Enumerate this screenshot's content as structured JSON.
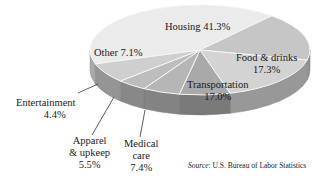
{
  "chart_data": {
    "type": "pie",
    "style": "3d",
    "title": "",
    "slices": [
      {
        "label": "Housing",
        "value": 41.3,
        "display": "Housing 41.3%",
        "color": "#ebebeb"
      },
      {
        "label": "Food & drinks",
        "value": 17.3,
        "display_line1": "Food & drinks",
        "display_line2": "17.3%",
        "color": "#c6c6c6"
      },
      {
        "label": "Transportation",
        "value": 17.0,
        "display_line1": "Transportation",
        "display_line2": "17.0%",
        "color": "#d3d3d3"
      },
      {
        "label": "Medical care",
        "value": 7.4,
        "display_line1": "Medical",
        "display_line2": "care",
        "display_line3": "7.4%",
        "color": "#a9a9a9"
      },
      {
        "label": "Apparel & upkeep",
        "value": 5.5,
        "display_line1": "Apparel",
        "display_line2": "& upkeep",
        "display_line3": "5.5%",
        "color": "#b6b6b6"
      },
      {
        "label": "Entertainment",
        "value": 4.4,
        "display_line1": "Entertainment",
        "display_line2": "4.4%",
        "color": "#bdbdbd"
      },
      {
        "label": "Other",
        "value": 7.1,
        "display": "Other 7.1%",
        "color": "#cfcfcf"
      }
    ],
    "source_label": "Source",
    "source_text": ": U.S. Bureau of Labor Statistics"
  }
}
